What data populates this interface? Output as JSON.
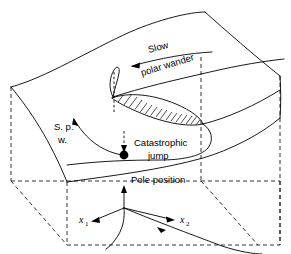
{
  "figure": {
    "name": "cusp-catastrophe-polar-wander-diagram",
    "background_color": "#ffffff",
    "line_color": "#000000"
  },
  "labels": {
    "slow": "Slow",
    "polar_wander": "polar wander",
    "spw_line1": "S. p.",
    "spw_line2": "w.",
    "catastrophic": "Catastrophic",
    "jump": "jump",
    "pole_position": "Pole position",
    "axis_x1_base": "x",
    "axis_x1_sub": "1",
    "axis_x2_base": "x",
    "axis_x2_sub": "2"
  },
  "elements": {
    "equilibrium_surface": "folded cusp catastrophe surface",
    "fold_region": "hatched overhang region",
    "catastrophic_jump_marker": "filled black dot",
    "jump_path": "vertical dashed arrow",
    "control_plane": "dashed parallelogram base",
    "bifurcation_set": "cusp curve on control plane"
  }
}
